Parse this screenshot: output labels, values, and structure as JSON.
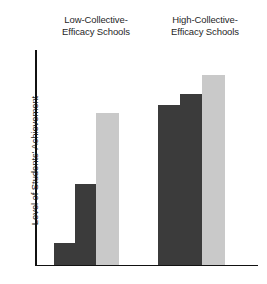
{
  "chart_data": {
    "type": "bar",
    "title": "",
    "subtitle": "",
    "xlabel": "",
    "ylabel": "Level of Students' Achievement",
    "groups": [
      "Low-Collective-\nEfficacy Schools",
      "High-Collective-\nEfficacy Schools"
    ],
    "group_labels_plain": [
      "Low-Collective-Efficacy Schools",
      "High-Collective-Efficacy Schools"
    ],
    "categories": [
      "Low-Collective-Efficacy Schools / bar 1",
      "Low-Collective-Efficacy Schools / bar 2",
      "Low-Collective-Efficacy Schools / bar 3",
      "High-Collective-Efficacy Schools / bar 1",
      "High-Collective-Efficacy Schools / bar 2",
      "High-Collective-Efficacy Schools / bar 3"
    ],
    "values": [
      10,
      38,
      71,
      74,
      79,
      88
    ],
    "ylim": [
      0,
      100
    ],
    "xlim": [
      0,
      100
    ],
    "grid": false,
    "legend": false,
    "axis_ticks": false,
    "tick_labels": [],
    "annotations": [],
    "bars": [
      {
        "group": 0,
        "index": 0,
        "value": 10,
        "color": "#3b3b3b",
        "shade": "dark",
        "left_px": 54,
        "width_px": 21,
        "top_px": 243,
        "height_px": 22
      },
      {
        "group": 0,
        "index": 1,
        "value": 38,
        "color": "#3b3b3b",
        "shade": "dark",
        "left_px": 75,
        "width_px": 21,
        "top_px": 184,
        "height_px": 81
      },
      {
        "group": 0,
        "index": 2,
        "value": 71,
        "color": "#c9c9c9",
        "shade": "light",
        "left_px": 96,
        "width_px": 23,
        "top_px": 113,
        "height_px": 152
      },
      {
        "group": 1,
        "index": 0,
        "value": 74,
        "color": "#3b3b3b",
        "shade": "dark",
        "left_px": 158,
        "width_px": 22,
        "top_px": 105,
        "height_px": 160
      },
      {
        "group": 1,
        "index": 1,
        "value": 79,
        "color": "#3b3b3b",
        "shade": "dark",
        "left_px": 180,
        "width_px": 22,
        "top_px": 94,
        "height_px": 171
      },
      {
        "group": 1,
        "index": 2,
        "value": 88,
        "color": "#c9c9c9",
        "shade": "light",
        "left_px": 202,
        "width_px": 23,
        "top_px": 75,
        "height_px": 190
      }
    ],
    "colors": {
      "dark_bar": "#3b3b3b",
      "light_bar": "#c9c9c9",
      "axis": "#111111",
      "text": "#1f1f1f",
      "background": "#ffffff"
    }
  },
  "figure": {
    "group_title_low": "Low-Collective-\nEfficacy Schools",
    "group_title_high": "High-Collective-\nEfficacy Schools",
    "y_axis_label": "Level of Students' Achievement"
  }
}
